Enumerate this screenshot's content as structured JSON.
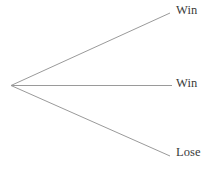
{
  "diagram": {
    "kind": "probability-tree-diagram",
    "background_color": "#ffffff",
    "line_color": "#9a9a9a",
    "line_width": 1,
    "text_color": "#3b3b3b",
    "root": {
      "name": "tree-root-node",
      "x": 11,
      "y": 85.5
    },
    "branches": [
      {
        "id": "branch-top",
        "label": "Win",
        "end_x": 170,
        "end_y": 13,
        "label_x": 176,
        "label_y": 4
      },
      {
        "id": "branch-middle",
        "label": "Win",
        "end_x": 172,
        "end_y": 85.5,
        "label_x": 176,
        "label_y": 77
      },
      {
        "id": "branch-bottom",
        "label": "Lose",
        "end_x": 170,
        "end_y": 156,
        "label_x": 176,
        "label_y": 146
      }
    ]
  }
}
